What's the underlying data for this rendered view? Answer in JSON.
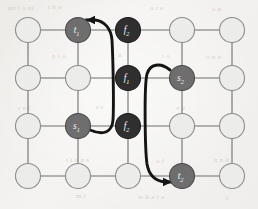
{
  "figure": {
    "name": "grid-graph-with-two-routed-paths",
    "background_color": "#f2f1ef",
    "grid": {
      "rows": 4,
      "cols": 5,
      "x_positions": [
        28,
        78,
        128,
        182,
        232
      ],
      "y_positions": [
        30,
        78,
        126,
        176
      ],
      "edge_color": "#6f6f6f",
      "edge_width": 1.1
    },
    "node_style": {
      "radius": 12.5,
      "plain_fill": "#ececea",
      "plain_stroke": "#8d8d8d",
      "terminal_fill": "#6e6e6e",
      "terminal_stroke": "#4a4a4a",
      "obstacle_fill": "#2f2f2f",
      "obstacle_stroke": "#1d1d1d",
      "label_color": "#f4f4f2"
    },
    "nodes": [
      {
        "id": "n-0-0",
        "row": 0,
        "col": 0,
        "kind": "plain",
        "label": "",
        "sub": ""
      },
      {
        "id": "n-0-1",
        "row": 0,
        "col": 1,
        "kind": "terminal",
        "label": "t",
        "sub": "1"
      },
      {
        "id": "n-0-2",
        "row": 0,
        "col": 2,
        "kind": "obstacle",
        "label": "f",
        "sub": "2"
      },
      {
        "id": "n-0-3",
        "row": 0,
        "col": 3,
        "kind": "plain",
        "label": "",
        "sub": ""
      },
      {
        "id": "n-0-4",
        "row": 0,
        "col": 4,
        "kind": "plain",
        "label": "",
        "sub": ""
      },
      {
        "id": "n-1-0",
        "row": 1,
        "col": 0,
        "kind": "plain",
        "label": "",
        "sub": ""
      },
      {
        "id": "n-1-1",
        "row": 1,
        "col": 1,
        "kind": "plain",
        "label": "",
        "sub": ""
      },
      {
        "id": "n-1-2",
        "row": 1,
        "col": 2,
        "kind": "obstacle",
        "label": "f",
        "sub": "1"
      },
      {
        "id": "n-1-3",
        "row": 1,
        "col": 3,
        "kind": "terminal",
        "label": "s",
        "sub": "2"
      },
      {
        "id": "n-1-4",
        "row": 1,
        "col": 4,
        "kind": "plain",
        "label": "",
        "sub": ""
      },
      {
        "id": "n-2-0",
        "row": 2,
        "col": 0,
        "kind": "plain",
        "label": "",
        "sub": ""
      },
      {
        "id": "n-2-1",
        "row": 2,
        "col": 1,
        "kind": "terminal",
        "label": "s",
        "sub": "1"
      },
      {
        "id": "n-2-2",
        "row": 2,
        "col": 2,
        "kind": "obstacle",
        "label": "f",
        "sub": "2"
      },
      {
        "id": "n-2-3",
        "row": 2,
        "col": 3,
        "kind": "plain",
        "label": "",
        "sub": ""
      },
      {
        "id": "n-2-4",
        "row": 2,
        "col": 4,
        "kind": "plain",
        "label": "",
        "sub": ""
      },
      {
        "id": "n-3-0",
        "row": 3,
        "col": 0,
        "kind": "plain",
        "label": "",
        "sub": ""
      },
      {
        "id": "n-3-1",
        "row": 3,
        "col": 1,
        "kind": "plain",
        "label": "",
        "sub": ""
      },
      {
        "id": "n-3-2",
        "row": 3,
        "col": 2,
        "kind": "plain",
        "label": "",
        "sub": ""
      },
      {
        "id": "n-3-3",
        "row": 3,
        "col": 3,
        "kind": "terminal",
        "label": "t",
        "sub": "2"
      },
      {
        "id": "n-3-4",
        "row": 3,
        "col": 4,
        "kind": "plain",
        "label": "",
        "sub": ""
      }
    ],
    "routes": [
      {
        "id": "route-1",
        "name": "path-s1-to-t1",
        "from": "s1",
        "to": "t1",
        "color": "#141414",
        "width": 2.9,
        "path": "M 90 130 C 104 136 112 132 113 120 C 114 104 113 58 112 40 C 111 28 104 21 95 20 L 86 20"
      },
      {
        "id": "route-2",
        "name": "path-s2-to-t2",
        "from": "s2",
        "to": "t2",
        "color": "#141414",
        "width": 2.9,
        "path": "M 170 70 C 160 62 150 64 147 74 C 144 86 145 150 147 164 C 149 176 156 181 165 182 L 172 182"
      }
    ],
    "arrowheads": [
      {
        "id": "arrow-1",
        "name": "arrowhead-into-t1",
        "x": 86,
        "y": 20,
        "angle": 180,
        "color": "#141414"
      },
      {
        "id": "arrow-2",
        "name": "arrowhead-into-t2",
        "x": 172,
        "y": 182,
        "angle": 0,
        "color": "#141414"
      }
    ],
    "background_bleed": [
      {
        "text": "un  l o   ut",
        "x": 8,
        "y": 4
      },
      {
        "text": "t h  e",
        "x": 48,
        "y": 3
      },
      {
        "text": "a  r  e",
        "x": 150,
        "y": 4
      },
      {
        "text": "o n",
        "x": 212,
        "y": 5
      },
      {
        "text": "p  l  o",
        "x": 52,
        "y": 52
      },
      {
        "text": "n",
        "x": 118,
        "y": 51
      },
      {
        "text": "t o",
        "x": 162,
        "y": 52
      },
      {
        "text": "o  n e",
        "x": 206,
        "y": 53
      },
      {
        "text": "r  e  l",
        "x": 18,
        "y": 104
      },
      {
        "text": "s  t",
        "x": 96,
        "y": 103
      },
      {
        "text": "v  e",
        "x": 176,
        "y": 104
      },
      {
        "text": "t i o n s",
        "x": 66,
        "y": 156
      },
      {
        "text": "o  f",
        "x": 156,
        "y": 157
      },
      {
        "text": "a  n  d",
        "x": 214,
        "y": 156
      },
      {
        "text": "m  i",
        "x": 76,
        "y": 192
      },
      {
        "text": "w  h  e  r  e",
        "x": 138,
        "y": 193
      },
      {
        "text": "t",
        "x": 226,
        "y": 194
      }
    ]
  }
}
